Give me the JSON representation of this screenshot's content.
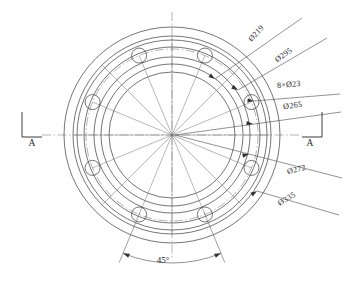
{
  "drawing": {
    "title": "Flange Front View",
    "view_label": "A-A section view markers",
    "background_color": "#ffffff",
    "line_color": "#3a3a3a",
    "center": {
      "x": 172,
      "y": 135
    }
  },
  "dimensions": [
    {
      "id": "dia-219",
      "label": "Ø219",
      "value": 219,
      "kind": "diameter",
      "radius_px": 71,
      "text_x": 258,
      "text_y": 35,
      "text_rotation": -48,
      "leader": {
        "x1": 215,
        "y1": 79,
        "x2": 302,
        "y2": 18
      },
      "arrow_at": {
        "x": 215,
        "y": 79
      },
      "arrow_angle": 215
    },
    {
      "id": "dia-295",
      "label": "Ø295",
      "value": 295,
      "kind": "diameter",
      "radius_px": 95,
      "text_x": 285,
      "text_y": 57,
      "text_rotation": -36,
      "leader": {
        "x1": 238,
        "y1": 90,
        "x2": 327,
        "y2": 38
      },
      "arrow_at": {
        "x": 238,
        "y": 90
      },
      "arrow_angle": 210
    },
    {
      "id": "holes-8x23",
      "label": "8×Ø23",
      "value": 23,
      "count": 8,
      "kind": "hole-pattern",
      "text_x": 289,
      "text_y": 87,
      "text_rotation": -5,
      "leader": {
        "x1": 254,
        "y1": 101,
        "x2": 340,
        "y2": 94
      },
      "arrow_at": {
        "x": 254,
        "y": 101
      },
      "arrow_angle": 186
    },
    {
      "id": "dia-265",
      "label": "Ø265",
      "value": 265,
      "kind": "diameter",
      "radius_px": 86,
      "text_x": 293,
      "text_y": 108,
      "text_rotation": -8,
      "leader": {
        "x1": 175,
        "y1": 135,
        "x2": 341,
        "y2": 112
      },
      "arrow_at": {
        "x": 253,
        "y": 124
      },
      "arrow_angle": 188
    },
    {
      "id": "dia-272",
      "label": "Ø272",
      "value": 272,
      "kind": "diameter",
      "radius_px": 88,
      "text_x": 297,
      "text_y": 172,
      "text_rotation": -14,
      "leader": {
        "x1": 175,
        "y1": 135,
        "x2": 342,
        "y2": 178
      },
      "arrow_at": {
        "x": 249,
        "y": 154
      },
      "arrow_angle": 166
    },
    {
      "id": "dia-335",
      "label": "Ø335",
      "value": 335,
      "kind": "diameter",
      "radius_px": 108,
      "text_x": 288,
      "text_y": 201,
      "text_rotation": -31,
      "leader": {
        "x1": 257,
        "y1": 191,
        "x2": 339,
        "y2": 215
      },
      "arrow_at": {
        "x": 257,
        "y": 191
      },
      "arrow_angle": 146
    }
  ],
  "angular_dimension": {
    "id": "angle-45",
    "label": "45°",
    "value": 45,
    "unit": "degrees",
    "text_x": 163,
    "text_y": 263,
    "arc_radius_px": 128,
    "start_angle_deg": 67.5,
    "end_angle_deg": 112.5
  },
  "section_markers": [
    {
      "id": "section-a-left",
      "label": "A",
      "text_x": 32,
      "text_y": 146,
      "bracket": "left",
      "bracket_x": 22,
      "bracket_y": 112,
      "bracket_w": 20,
      "bracket_h": 25
    },
    {
      "id": "section-a-right",
      "label": "A",
      "text_x": 310,
      "text_y": 146,
      "bracket": "right",
      "bracket_x": 302,
      "bracket_y": 112,
      "bracket_w": 20,
      "bracket_h": 25
    }
  ],
  "geometry": {
    "concentric_circles": [
      {
        "id": "circle-outer-335",
        "r": 108,
        "style": "solid"
      },
      {
        "id": "circle-295-outer",
        "r": 99,
        "style": "solid"
      },
      {
        "id": "circle-295",
        "r": 95,
        "style": "solid"
      },
      {
        "id": "circle-272",
        "r": 88,
        "style": "solid"
      },
      {
        "id": "circle-bolt-265",
        "r": 86,
        "style": "center"
      },
      {
        "id": "circle-raised-face",
        "r": 78,
        "style": "solid"
      },
      {
        "id": "circle-bore-outer",
        "r": 71,
        "style": "solid"
      },
      {
        "id": "circle-bore-inner",
        "r": 63,
        "style": "solid"
      }
    ],
    "bolt_holes": {
      "count": 8,
      "hole_radius_px": 7.5,
      "bolt_circle_radius_px": 86,
      "start_angle_deg": 22.5,
      "pitch_deg": 45
    },
    "radial_lines": {
      "count": 16,
      "start_angle_deg": 0,
      "pitch_deg": 22.5
    },
    "centerlines": {
      "horizontal": {
        "x1": 42,
        "y1": 135,
        "x2": 302,
        "y2": 135
      },
      "vertical": {
        "x1": 172,
        "y1": 12,
        "x2": 172,
        "y2": 258
      }
    }
  }
}
